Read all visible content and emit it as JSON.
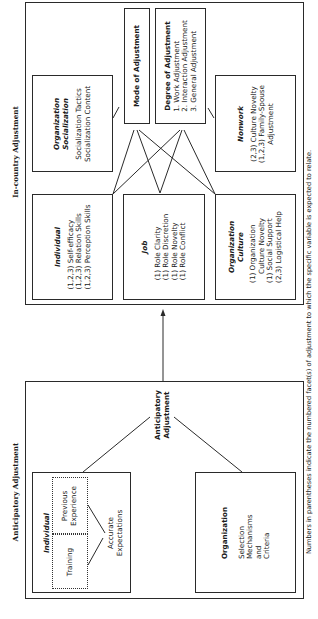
{
  "in_country": {
    "label": "In-country Adjustment",
    "mode_box": {
      "title": "Mode of Adjustment"
    },
    "degree_box": {
      "title": "Degree of Adjustment",
      "items": [
        "1. Work Adjustment",
        "2. Interaction Adjustment",
        "3. General Adjustment"
      ]
    },
    "org_socialization": {
      "title_line1": "Organization",
      "title_line2": "Socialization",
      "items": [
        "Socialization Tactics",
        "Socialization Content"
      ]
    },
    "nonwork": {
      "title": "Nonwork",
      "items": [
        "(2,3) Culture Novelty",
        "(1,2,3) Family-Spouse",
        "Adjustment"
      ]
    },
    "individual": {
      "title": "Individual",
      "items": [
        "(1,2,3) Self-efficacy",
        "(1,2,3) Relation Skills",
        "(1,2,3) Perception Skills"
      ]
    },
    "job": {
      "title": "Job",
      "items": [
        "(1) Role Clarity",
        "(1) Role Discretion",
        "(1) Role Novelty",
        "(1) Role Conflict"
      ]
    },
    "org_culture": {
      "title_line1": "Organization",
      "title_line2": "Culture",
      "items": [
        "(1) Organization",
        "Culture Novelty",
        "(1) Social Support",
        "(2,3) Logistical Help"
      ]
    }
  },
  "anticipatory": {
    "label": "Anticipatory Adjustment",
    "center_label_line1": "Anticipatory",
    "center_label_line2": "Adjustment",
    "individual": {
      "title": "Individual",
      "previous_experience_line1": "Previous",
      "previous_experience_line2": "Experience",
      "training": "Training",
      "accurate_line1": "Accurate",
      "accurate_line2": "Expectations"
    },
    "organization": {
      "title": "Organization",
      "items": [
        "Selection",
        "Mechanisms",
        "and",
        "Criteria"
      ]
    }
  },
  "footnote": "Numbers in parentheses indicate the numbered facet(s) of adjustment to which the specific variable is expected to relate."
}
